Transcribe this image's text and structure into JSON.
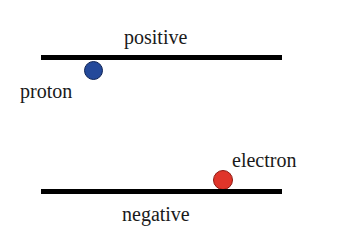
{
  "diagram": {
    "top_plate": {
      "label": "positive",
      "color": "#000000"
    },
    "bottom_plate": {
      "label": "negative",
      "color": "#000000"
    },
    "proton": {
      "label": "proton",
      "color": "#24499a",
      "border": "#0f2456"
    },
    "electron": {
      "label": "electron",
      "color": "#e0352a",
      "border": "#8e1a12"
    }
  }
}
